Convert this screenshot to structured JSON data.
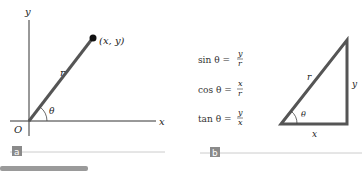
{
  "panel_a": {
    "badge": "a",
    "axis_y_label": "y",
    "axis_x_label": "x",
    "origin_label": "O",
    "point_label": "(x, y)",
    "radius_label": "r",
    "angle_label": "θ"
  },
  "panel_b": {
    "badge": "b",
    "equations": [
      {
        "lhs": "sin θ =",
        "num": "y",
        "den": "r"
      },
      {
        "lhs": "cos θ =",
        "num": "x",
        "den": "r"
      },
      {
        "lhs": "tan θ =",
        "num": "y",
        "den": "x"
      }
    ],
    "hypotenuse_label": "r",
    "opposite_label": "y",
    "adjacent_label": "x",
    "angle_label": "θ"
  },
  "colors": {
    "line": "#555555",
    "badge": "#8a8a8a",
    "rule": "#cccccc",
    "footer_bar": "#9a9a9a"
  }
}
